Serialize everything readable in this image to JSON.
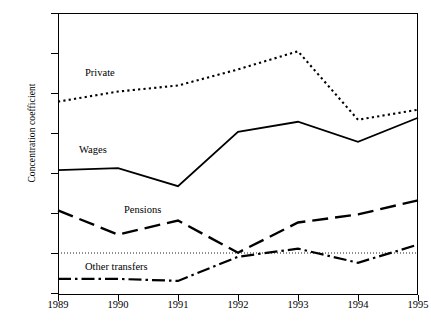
{
  "chart_data": {
    "type": "line",
    "title": "",
    "xlabel": "",
    "ylabel": "Concentration coefficient",
    "x": [
      1989,
      1990,
      1991,
      1992,
      1993,
      1994,
      1995
    ],
    "categories": [
      "1989",
      "1990",
      "1991",
      "1992",
      "1993",
      "1994",
      "1995"
    ],
    "ylim": [
      -10,
      60
    ],
    "yticks": [
      -10,
      0,
      10,
      20,
      30,
      40,
      50,
      60
    ],
    "ytick_labels": [
      "-10",
      "0",
      "10",
      "20",
      "30",
      "40",
      "50",
      "60"
    ],
    "grid": false,
    "zero_line": true,
    "legend_position": "inline-annotations",
    "series": [
      {
        "name": "Private",
        "style": "dotted",
        "color": "#000000",
        "values": [
          38,
          40.5,
          42,
          46,
          50.5,
          33.5,
          36
        ]
      },
      {
        "name": "Wages",
        "style": "solid",
        "color": "#000000",
        "values": [
          21,
          21.5,
          17,
          30.5,
          33,
          28,
          34
        ]
      },
      {
        "name": "Pensions",
        "style": "dashed",
        "color": "#000000",
        "values": [
          11,
          5,
          8.5,
          0.5,
          8,
          10,
          13.5
        ]
      },
      {
        "name": "Other transfers",
        "style": "dash-dot",
        "color": "#000000",
        "values": [
          -6,
          -6,
          -6.5,
          -0.5,
          1.5,
          -2,
          2.5
        ]
      }
    ],
    "annotations": [
      {
        "text": "Private",
        "x": 1989.45,
        "y": 44.5
      },
      {
        "text": "Wages",
        "x": 1989.35,
        "y": 25.5
      },
      {
        "text": "Pensions",
        "x": 1990.1,
        "y": 10.5
      },
      {
        "text": "Other transfers",
        "x": 1989.45,
        "y": -3.5
      }
    ]
  }
}
